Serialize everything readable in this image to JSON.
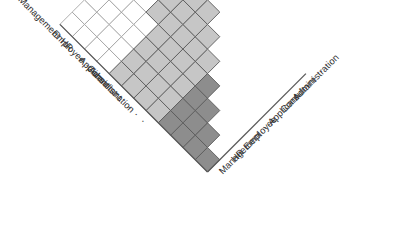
{
  "figure": {
    "title": "",
    "type": "rotated-triangular-matrix",
    "geometry": {
      "cell_size": 24.6,
      "apex_x": 207.5,
      "apex_y": 172.0,
      "rotation_degrees": 45,
      "matrix_order": 8
    },
    "colors": {
      "dark_cell": "#8d8d8d",
      "light_cell": "#c6c6c6",
      "empty_cell": "#ffffff",
      "grid_line": "#5a5a5a",
      "grid_line_light": "#9a9a9a",
      "label_text": "#2e2e2e",
      "background": "#ffffff"
    },
    "shading_legend": {
      "dark_label": "dark gray",
      "light_label": "light gray",
      "empty_label": "white"
    }
  },
  "chart_data": {
    "type": "heatmap",
    "title": "",
    "xlabel": "",
    "ylabel": "",
    "categories": [
      "Management",
      "HR",
      "Employee",
      "· · ·",
      "Applicant",
      "Consultant",
      "Administration",
      "· · ·"
    ],
    "row_labels": [
      "Management",
      "HR",
      "Employee",
      "· · ·",
      "Applicant",
      "Consultant",
      "Administration",
      "· · ·"
    ],
    "column_labels": [
      "Management",
      "HR",
      "Employee",
      "· · ·",
      "Applicant",
      "Consultant",
      "Administration",
      "· · ·"
    ],
    "value_scale": [
      {
        "key": "dark",
        "value": 2
      },
      {
        "key": "light",
        "value": 1
      },
      {
        "key": "empty",
        "value": 0
      }
    ],
    "triangular": "lower",
    "rows": [
      [
        2
      ],
      [
        2,
        2
      ],
      [
        2,
        2,
        2
      ],
      [
        2,
        2,
        2,
        2
      ],
      [
        1,
        1,
        1,
        1,
        1
      ],
      [
        1,
        1,
        1,
        1,
        1,
        1
      ],
      [
        1,
        1,
        1,
        1,
        1,
        1,
        1
      ],
      [
        1,
        1,
        1,
        1,
        1,
        1,
        1,
        1
      ],
      [
        0,
        0,
        0,
        0,
        1,
        1,
        1,
        1
      ],
      [
        0,
        0,
        0,
        0,
        0,
        1,
        1,
        1
      ],
      [
        0,
        0,
        0,
        0,
        0,
        0,
        1,
        1
      ],
      [
        0,
        0,
        0,
        0,
        0,
        0,
        0,
        1
      ]
    ],
    "grid": true,
    "legend_position": "none"
  },
  "labels": {
    "left_edge": [
      {
        "text": "Management",
        "index": 0
      },
      {
        "text": "HR",
        "index": 1
      },
      {
        "text": "Employee",
        "index": 2
      },
      {
        "text": "· · ·",
        "index": 3,
        "is_ellipsis": true
      },
      {
        "text": "Applicant",
        "index": 4
      },
      {
        "text": "Consultant",
        "index": 5
      },
      {
        "text": "Administration",
        "index": 6
      },
      {
        "text": "· · ·",
        "index": 7,
        "is_ellipsis": true
      }
    ],
    "right_edge": [
      {
        "text": "Management",
        "index": 0
      },
      {
        "text": "HR",
        "index": 1
      },
      {
        "text": "Employee",
        "index": 2
      },
      {
        "text": "· · ·",
        "index": 3,
        "is_ellipsis": true
      },
      {
        "text": "Applicant",
        "index": 4
      },
      {
        "text": "Consultant",
        "index": 5
      },
      {
        "text": "Administration",
        "index": 6
      },
      {
        "text": "· · ·",
        "index": 7,
        "is_ellipsis": true
      }
    ]
  }
}
